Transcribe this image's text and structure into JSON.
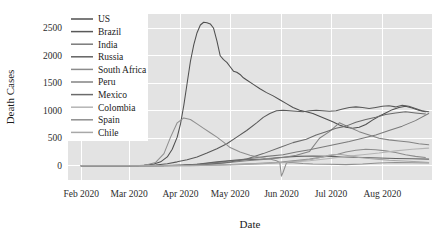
{
  "chart_data": {
    "type": "line",
    "title": "",
    "xlabel": "Date",
    "ylabel": "Death Cases",
    "grid": true,
    "legend_position": "top-left-inside",
    "x_tick_labels": [
      "Feb 2020",
      "Mar 2020",
      "Apr 2020",
      "May 2020",
      "Jun 2020",
      "Jul 2020",
      "Aug 2020"
    ],
    "x_tick_values": [
      0,
      29,
      60,
      90,
      121,
      151,
      182
    ],
    "xlim": [
      -8,
      212
    ],
    "y_tick_labels": [
      "0",
      "500",
      "1000",
      "1500",
      "2000",
      "2500"
    ],
    "y_tick_values": [
      0,
      500,
      1000,
      1500,
      2000,
      2500
    ],
    "ylim": [
      -260,
      2760
    ],
    "x_unit": "days since 2020-02-01",
    "series": [
      {
        "name": "US",
        "color": "#4f4f4f",
        "x": [
          0,
          10,
          20,
          30,
          38,
          44,
          48,
          52,
          55,
          58,
          60,
          62,
          64,
          66,
          68,
          70,
          72,
          74,
          76,
          78,
          80,
          82,
          84,
          86,
          88,
          90,
          92,
          94,
          96,
          98,
          100,
          104,
          108,
          112,
          116,
          120,
          124,
          128,
          132,
          136,
          140,
          144,
          148,
          152,
          156,
          160,
          164,
          168,
          172,
          176,
          180,
          184,
          188,
          192,
          196,
          200,
          204,
          208
        ],
        "values": [
          0,
          0,
          0,
          2,
          10,
          30,
          70,
          160,
          300,
          520,
          760,
          1100,
          1500,
          1900,
          2200,
          2420,
          2560,
          2610,
          2600,
          2580,
          2500,
          2270,
          2000,
          1930,
          1880,
          1800,
          1720,
          1700,
          1660,
          1600,
          1560,
          1480,
          1400,
          1330,
          1270,
          1200,
          1130,
          1060,
          1010,
          980,
          950,
          900,
          850,
          800,
          740,
          700,
          680,
          700,
          750,
          830,
          900,
          960,
          1020,
          1060,
          1080,
          1050,
          1010,
          980
        ]
      },
      {
        "name": "Brazil",
        "color": "#595959",
        "x": [
          0,
          20,
          35,
          45,
          52,
          58,
          64,
          70,
          76,
          82,
          88,
          94,
          100,
          106,
          110,
          114,
          118,
          122,
          126,
          130,
          134,
          138,
          142,
          146,
          150,
          154,
          158,
          162,
          166,
          170,
          174,
          178,
          182,
          186,
          190,
          194,
          198,
          202,
          206,
          210
        ],
        "values": [
          0,
          0,
          2,
          12,
          35,
          70,
          110,
          160,
          230,
          310,
          400,
          520,
          640,
          780,
          880,
          950,
          1000,
          1010,
          1000,
          990,
          980,
          1000,
          1010,
          1000,
          990,
          1000,
          1030,
          1060,
          1070,
          1060,
          1040,
          1060,
          1080,
          1090,
          1070,
          1100,
          1080,
          1040,
          1000,
          980
        ]
      },
      {
        "name": "India",
        "color": "#7a7a7a",
        "x": [
          0,
          30,
          50,
          62,
          72,
          82,
          92,
          102,
          112,
          122,
          130,
          138,
          146,
          154,
          162,
          170,
          178,
          186,
          194,
          202,
          210
        ],
        "values": [
          0,
          0,
          2,
          12,
          30,
          60,
          95,
          130,
          170,
          200,
          250,
          290,
          340,
          390,
          440,
          500,
          560,
          640,
          720,
          820,
          950
        ]
      },
      {
        "name": "Russia",
        "color": "#626262",
        "x": [
          0,
          30,
          55,
          70,
          82,
          92,
          100,
          110,
          120,
          130,
          140,
          150,
          160,
          170,
          180,
          190,
          200,
          210
        ],
        "values": [
          0,
          0,
          3,
          25,
          70,
          100,
          110,
          120,
          150,
          170,
          175,
          170,
          160,
          150,
          140,
          130,
          125,
          120
        ]
      },
      {
        "name": "South Africa",
        "color": "#8c8c8c",
        "x": [
          0,
          40,
          60,
          75,
          90,
          105,
          118,
          128,
          138,
          148,
          155,
          160,
          166,
          172,
          178,
          184,
          190,
          196,
          202,
          208
        ],
        "values": [
          0,
          0,
          3,
          10,
          22,
          40,
          60,
          90,
          120,
          170,
          210,
          250,
          280,
          300,
          290,
          270,
          240,
          200,
          170,
          150
        ]
      },
      {
        "name": "Peru",
        "color": "#838383",
        "x": [
          0,
          40,
          60,
          75,
          88,
          100,
          112,
          122,
          130,
          138,
          144,
          150,
          156,
          162,
          168,
          174,
          180,
          186,
          192,
          198,
          204,
          210
        ],
        "values": [
          0,
          0,
          3,
          20,
          55,
          90,
          120,
          150,
          190,
          260,
          500,
          620,
          780,
          700,
          620,
          560,
          500,
          470,
          450,
          430,
          400,
          380
        ]
      },
      {
        "name": "Mexico",
        "color": "#6b6b6b",
        "x": [
          0,
          40,
          62,
          75,
          88,
          100,
          110,
          120,
          128,
          136,
          142,
          148,
          154,
          160,
          166,
          172,
          178,
          184,
          190,
          196,
          202,
          208
        ],
        "values": [
          0,
          0,
          3,
          20,
          60,
          120,
          220,
          330,
          420,
          480,
          560,
          620,
          680,
          720,
          790,
          840,
          880,
          930,
          960,
          980,
          960,
          940
        ]
      },
      {
        "name": "Colombia",
        "color": "#b5b5b5",
        "x": [
          0,
          45,
          65,
          80,
          95,
          110,
          125,
          138,
          150,
          160,
          170,
          180,
          190,
          200,
          210
        ],
        "values": [
          0,
          0,
          2,
          10,
          22,
          40,
          60,
          90,
          130,
          170,
          200,
          230,
          270,
          300,
          320
        ]
      },
      {
        "name": "Spain",
        "color": "#8f8f8f",
        "x": [
          0,
          25,
          38,
          45,
          50,
          54,
          58,
          62,
          66,
          70,
          74,
          78,
          82,
          86,
          90,
          96,
          102,
          108,
          114,
          118,
          120,
          121,
          122,
          124,
          126,
          128,
          134,
          140,
          150,
          160,
          170,
          180,
          190,
          200,
          210
        ],
        "values": [
          0,
          0,
          5,
          60,
          220,
          520,
          780,
          870,
          840,
          760,
          680,
          600,
          520,
          430,
          330,
          250,
          190,
          150,
          120,
          90,
          60,
          -190,
          -120,
          50,
          60,
          55,
          40,
          30,
          25,
          20,
          30,
          50,
          60,
          55,
          50
        ]
      },
      {
        "name": "Chile",
        "color": "#a8a8a8",
        "x": [
          0,
          45,
          65,
          80,
          95,
          110,
          122,
          132,
          140,
          146,
          150,
          156,
          162,
          168,
          174,
          180,
          186,
          192,
          198,
          204,
          210
        ],
        "values": [
          0,
          0,
          2,
          8,
          18,
          35,
          60,
          90,
          120,
          160,
          195,
          210,
          180,
          150,
          130,
          115,
          100,
          90,
          80,
          70,
          60
        ]
      }
    ]
  },
  "legend": {
    "items": [
      {
        "label": "US"
      },
      {
        "label": "Brazil"
      },
      {
        "label": "India"
      },
      {
        "label": "Russia"
      },
      {
        "label": "South Africa"
      },
      {
        "label": "Peru"
      },
      {
        "label": "Mexico"
      },
      {
        "label": "Colombia"
      },
      {
        "label": "Spain"
      },
      {
        "label": "Chile"
      }
    ]
  },
  "theme": {
    "panel_background": "#e3e3e3",
    "gridline_color": "#ffffff",
    "figure_background": "#ffffff",
    "text_color": "#1a1a1a"
  }
}
